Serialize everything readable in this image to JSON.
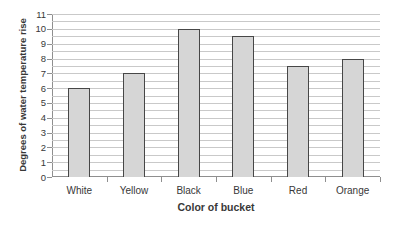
{
  "chart_data": {
    "type": "bar",
    "categories": [
      "White",
      "Yellow",
      "Black",
      "Blue",
      "Red",
      "Orange"
    ],
    "values": [
      6,
      7,
      10,
      9.5,
      7.5,
      8
    ],
    "xlabel": "Color of bucket",
    "ylabel": "Degrees of water temperature rise",
    "ylim": [
      0,
      11
    ],
    "y_ticks": [
      "0",
      "1",
      "2",
      "3",
      "4",
      "5",
      "6",
      "7",
      "8",
      "9",
      "10",
      "11"
    ],
    "gridline_step": 0.5,
    "grid": "horizontal",
    "legend_position": "none",
    "colors": {
      "background": "#ffffff",
      "bar_fill": "#d6d6d6",
      "bar_border": "#474747",
      "gridline": "#c9c9c9",
      "axis": "#8f8f8f",
      "text": "#383838"
    }
  }
}
